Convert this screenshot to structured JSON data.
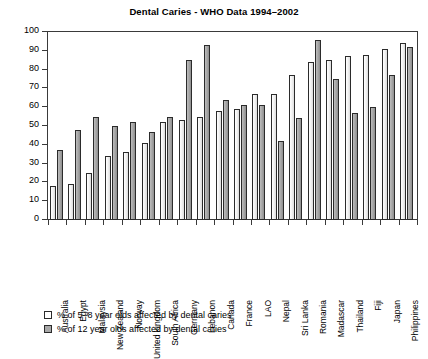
{
  "chart_data": {
    "type": "bar",
    "title": "Dental Caries - WHO Data 1994–2002",
    "xlabel": "",
    "ylabel": "",
    "ylim": [
      0,
      100
    ],
    "yticks": [
      0,
      10,
      20,
      30,
      40,
      50,
      60,
      70,
      80,
      90,
      100
    ],
    "grid": false,
    "legend_position": "below-left",
    "categories": [
      "Australia",
      "Egypt",
      "Malaysia",
      "New Zealand",
      "Norway",
      "United kingdom",
      "South Africa",
      "Germany",
      "Lebanon",
      "Canada",
      "France",
      "LAO",
      "Nepal",
      "Sri Lanka",
      "Romania",
      "Madascar",
      "Thailand",
      "Fiji",
      "Japan",
      "Philippines"
    ],
    "series": [
      {
        "name": "% of 5–8 year olds affected by dental caries",
        "color": "#f1f1f1",
        "values": [
          18,
          19,
          25,
          34,
          36,
          41,
          52,
          53,
          55,
          58,
          59,
          67,
          67,
          77,
          84,
          85,
          87,
          88,
          91,
          94
        ]
      },
      {
        "name": "% of 12 year olds affected by dental caries",
        "color": "#a8a8a8",
        "values": [
          37,
          48,
          55,
          50,
          52,
          47,
          55,
          85,
          93,
          64,
          61,
          61,
          42,
          54,
          96,
          75,
          57,
          60,
          77,
          92
        ]
      }
    ]
  },
  "legend": {
    "items": [
      {
        "swatch": "light",
        "label": "% of 5–8 year olds affected by dental caries"
      },
      {
        "swatch": "dark",
        "label": "% of 12 year olds affected by dental caries"
      }
    ]
  }
}
